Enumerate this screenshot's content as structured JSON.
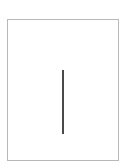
{
  "document": {
    "page_count": 1,
    "content": "",
    "border_color": "#b8b8b8",
    "cursor_color": "#4a4a4a"
  }
}
